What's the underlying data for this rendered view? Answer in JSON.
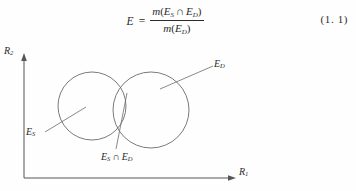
{
  "equation": {
    "lhs": "E",
    "relation": "=",
    "numerator": {
      "function": "m",
      "open_paren": "(",
      "set_a": "E",
      "set_a_sub": "S",
      "operator": "∩",
      "set_b": "E",
      "set_b_sub": "D",
      "close_paren": ")"
    },
    "denominator": {
      "function": "m",
      "open_paren": "(",
      "set": "E",
      "set_sub": "D",
      "close_paren": ")"
    },
    "number": "(1. 1)"
  },
  "figure": {
    "axes": {
      "y_label": "R",
      "y_label_sub": "2",
      "x_label": "R",
      "x_label_sub": "1",
      "origin": {
        "x": 24,
        "y": 140
      },
      "x_end": {
        "x": 235,
        "y": 140
      },
      "y_end": {
        "x": 24,
        "y": 17
      },
      "stroke": "#555555"
    },
    "sets": [
      {
        "name": "source-set",
        "label": "E",
        "label_sub": "S",
        "cx": 92,
        "cy": 68,
        "r": 34,
        "stroke": "#6b6b6b",
        "leader": {
          "x1": 47,
          "y1": 93,
          "x2": 84,
          "y2": 71
        }
      },
      {
        "name": "destination-set",
        "label": "E",
        "label_sub": "D",
        "cx": 151,
        "cy": 72,
        "r": 38,
        "stroke": "#6b6b6b",
        "leader": {
          "x1": 214,
          "y1": 27,
          "x2": 164,
          "y2": 53
        }
      }
    ],
    "intersection": {
      "label_set_a": "E",
      "label_set_a_sub": "S",
      "label_operator": "∩",
      "label_set_b": "E",
      "label_set_b_sub": "D",
      "leader": {
        "x1": 116,
        "y1": 112,
        "x2": 127,
        "y2": 56
      }
    }
  }
}
